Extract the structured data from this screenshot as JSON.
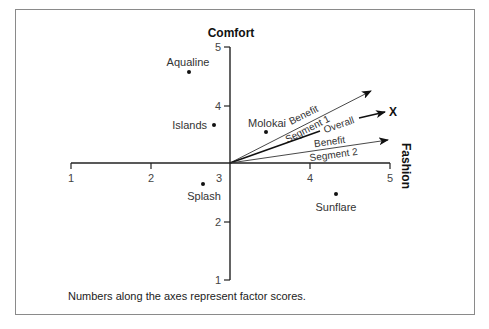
{
  "diagram": {
    "axes": {
      "x": {
        "title": "Fashion",
        "ticks": [
          "1",
          "2",
          "3",
          "4",
          "5"
        ]
      },
      "y": {
        "title": "Comfort",
        "ticks": [
          "1",
          "2",
          "3",
          "4",
          "5"
        ]
      }
    },
    "points": [
      {
        "label": "Aqualine",
        "fashion": 2.5,
        "comfort": 4.6
      },
      {
        "label": "Islands",
        "fashion": 2.8,
        "comfort": 3.65
      },
      {
        "label": "Molokai",
        "fashion": 3.45,
        "comfort": 3.55
      },
      {
        "label": "Splash",
        "fashion": 2.7,
        "comfort": 2.65
      },
      {
        "label": "Sunflare",
        "fashion": 4.35,
        "comfort": 2.5
      }
    ],
    "vectors": [
      {
        "label_line1": "Benefit",
        "label_line2": "Segment 1"
      },
      {
        "label_line1": "Overall",
        "end_label": "X"
      },
      {
        "label_line1": "Benefit",
        "label_line2": "Segment 2"
      }
    ],
    "footnote": "Numbers along the axes represent factor scores."
  }
}
